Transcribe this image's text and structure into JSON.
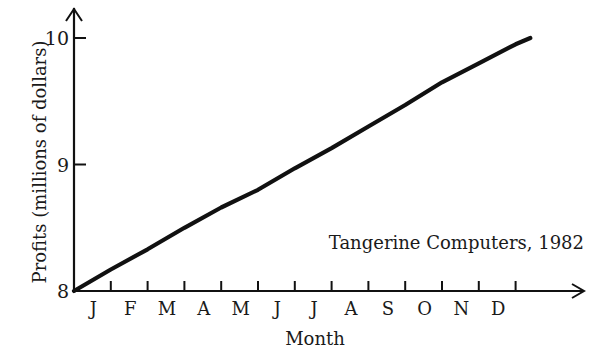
{
  "chart_data": {
    "type": "line",
    "title": "",
    "annotation": "Tangerine Computers, 1982",
    "xlabel": "Month",
    "ylabel": "Profits (millions of dollars)",
    "categories": [
      "J",
      "F",
      "M",
      "A",
      "M",
      "J",
      "J",
      "A",
      "S",
      "O",
      "N",
      "D"
    ],
    "yticks": [
      "8",
      "9",
      "10"
    ],
    "ylim": [
      8,
      10
    ],
    "grid": false,
    "legend": "none",
    "series": [
      {
        "name": "Tangerine Computers, 1982",
        "x": [
          0,
          1,
          2,
          3,
          4,
          5,
          6,
          7,
          8,
          9,
          10,
          11,
          12,
          12.4
        ],
        "values": [
          8.0,
          8.17,
          8.33,
          8.5,
          8.66,
          8.8,
          8.97,
          9.13,
          9.3,
          9.47,
          9.65,
          9.8,
          9.95,
          10.0
        ]
      }
    ]
  }
}
